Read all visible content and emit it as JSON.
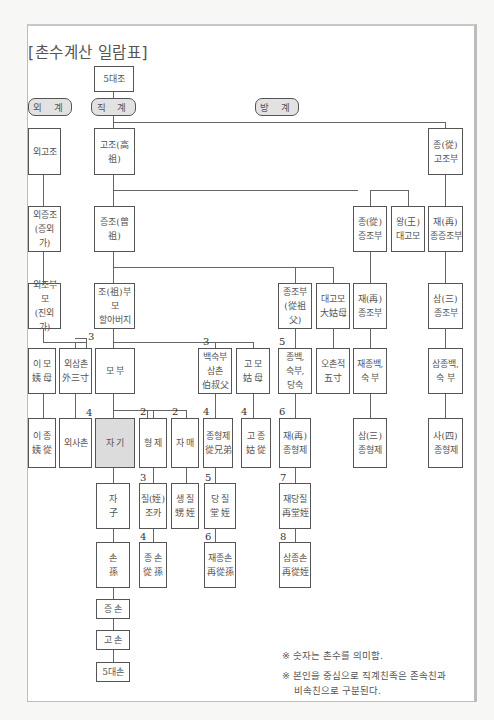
{
  "title": "[촌수계산 일람표]",
  "groups": {
    "outer": "외 계",
    "direct": "직 계",
    "collateral": "방 계"
  },
  "nodes": {
    "g5_ancestor": "5대조",
    "maternal_great_great": "외고조",
    "great_great_grandfather": "고조(高祖)",
    "jong_great_great_uncle": "종(從)\n고조부",
    "maternal_great_grand": "외증조\n(증외가)",
    "great_grandfather": "증조(曾祖)",
    "jong_great_grand_uncle": "종(從)\n증조부",
    "wang_great_aunt": "왕(王)\n대고모",
    "jae_great_grand_uncle": "재(再)\n종증조부",
    "maternal_grandparents": "외조부모\n(진외가)",
    "grandparents": "조(祖)부모\n할아버지",
    "jong_grand_uncle": "종조부\n(從祖父)",
    "great_aunt": "대고모\n大姑母",
    "jae_grand_uncle": "재(再)\n종조부",
    "sam_grand_uncle": "삼(三)\n종조부",
    "maternal_aunt": "이 모\n姨 母",
    "maternal_uncle": "외삼촌\n外三寸",
    "parents": "모 부",
    "paternal_uncles": "백숙부\n삼촌\n伯叔父",
    "paternal_aunt": "고 모\n姑 母",
    "jong_uncles": "종백,\n숙부,\n당숙",
    "fifth_degree": "오촌적\n五寸",
    "jae_jong_uncles": "재종백,\n숙 부",
    "sam_jong_uncles": "삼종백,\n숙 부",
    "maternal_aunt_cousin": "이 종\n姨 從",
    "maternal_cousin": "외사촌",
    "self": "자 기",
    "brothers": "형 제",
    "sisters": "자 매",
    "cousins": "종형제\n從兄弟",
    "aunt_cousins": "고 종\n姑 從",
    "jae_cousins": "재(再)\n종형제",
    "sam_cousins": "삼(三)\n종형제",
    "sa_cousins": "사(四)\n종형제",
    "children": "자\n子",
    "nephew": "질(姪)\n조카",
    "sister_nephew": "생 질\n甥 姪",
    "dang_nephew": "당 질\n堂 姪",
    "jae_dang_nephew": "재당질\n再堂姪",
    "grandchildren": "손\n孫",
    "jong_grandchildren": "종 손\n從 孫",
    "jae_jong_grandchildren": "재종손\n再從孫",
    "sam_jong_grandchildren": "삼종손\n再從姪",
    "great_grandchildren": "증 손",
    "great_great_grandchildren": "고 손",
    "g5_descendant": "5대손"
  },
  "degrees": {
    "maternal_uncle": "3",
    "maternal_cousin": "4",
    "paternal_uncles": "3",
    "cousins": "4",
    "aunt_cousins": "4",
    "brothers": "2",
    "sisters": "2",
    "jong_uncles": "5",
    "jae_cousins": "6",
    "nephew": "3",
    "dang_nephew": "5",
    "jae_dang_nephew": "7",
    "jong_grandchildren": "4",
    "jae_jong_grandchildren": "6",
    "sam_jong_grandchildren": "8"
  },
  "notes": [
    "※ 숫자는 촌수를 의미함.",
    "※ 본인을 중심으로 직계친족은 존속친과\n    비속친으로 구분된다."
  ]
}
